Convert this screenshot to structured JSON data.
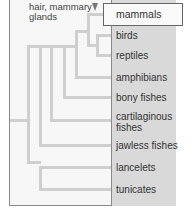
{
  "diagram": {
    "type": "cladogram",
    "trait_annotation": {
      "line1": "hair, mammary",
      "line2": "glands",
      "marker": "down-triangle"
    },
    "highlighted_taxon": "mammals",
    "taxa": [
      {
        "label": "mammals"
      },
      {
        "label": "birds"
      },
      {
        "label": "reptiles"
      },
      {
        "label": "amphibians"
      },
      {
        "label": "bony fishes"
      },
      {
        "label": "cartilaginous",
        "label2": "fishes"
      },
      {
        "label": "jawless fishes"
      },
      {
        "label": "lancelets"
      },
      {
        "label": "tunicates"
      }
    ],
    "colors": {
      "branch": "#cfcfcf",
      "panel": "#d9d9d9",
      "frame": "#8a8a8a",
      "highlight_box": "#f9f9f9"
    }
  }
}
